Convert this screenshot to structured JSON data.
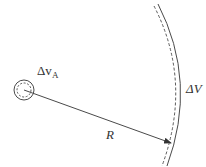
{
  "diagram": {
    "type": "physics-geometry",
    "stroke_color": "#4a4a4a",
    "background": "#ffffff",
    "small_volume": {
      "label_main": "Δv",
      "label_sub": "A",
      "center": [
        24,
        90
      ],
      "outer_radius": 10,
      "inner_radius": 7
    },
    "radius_line": {
      "label": "R",
      "from": [
        24,
        90
      ],
      "to": [
        198,
        143
      ]
    },
    "shell": {
      "label": "ΔV"
    }
  }
}
